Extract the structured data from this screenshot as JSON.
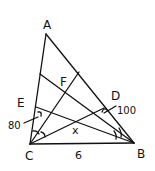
{
  "diagram": {
    "type": "geometry-triangle",
    "stroke_color": "#111111",
    "background": "#ffffff",
    "points": {
      "A": {
        "label": "A",
        "x": 46,
        "y": 34
      },
      "B": {
        "label": "B",
        "x": 134,
        "y": 143
      },
      "C": {
        "label": "C",
        "x": 30,
        "y": 144
      },
      "D": {
        "label": "D",
        "x": 104,
        "y": 108
      },
      "E": {
        "label": "E",
        "x": 36,
        "y": 109
      },
      "F": {
        "label": "F",
        "x": 64,
        "y": 88
      },
      "X": {
        "label": "x",
        "x": 77,
        "y": 124
      }
    },
    "labels": {
      "A": "A",
      "B": "B",
      "C": "C",
      "D": "D",
      "E": "E",
      "F": "F",
      "X": "x",
      "side_CB": "6",
      "angle_E": "80",
      "angle_D": "100"
    }
  }
}
